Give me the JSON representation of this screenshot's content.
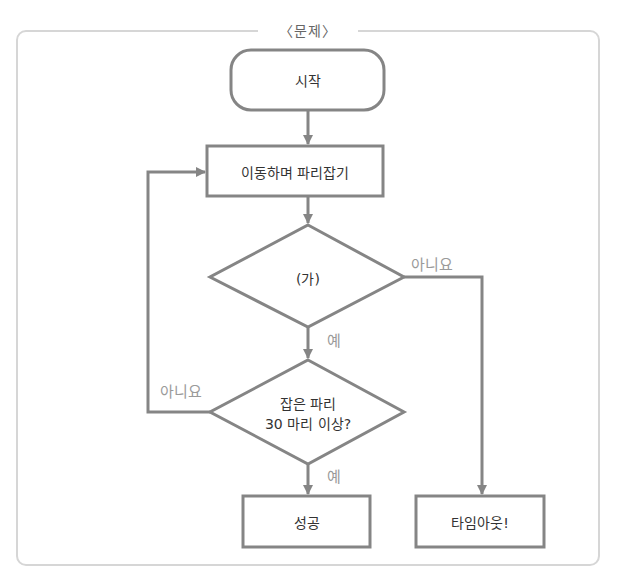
{
  "header": {
    "title": "〈문제〉"
  },
  "colors": {
    "stroke": "#858585",
    "frame": "#d6d6d6",
    "text": "#333333",
    "edge_label": "#9a9a9a"
  },
  "nodes": {
    "start": {
      "type": "terminal",
      "label": "시작"
    },
    "process": {
      "type": "process",
      "label": "이동하며 파리잡기"
    },
    "decision_a": {
      "type": "decision",
      "label": "(가)"
    },
    "decision_b": {
      "type": "decision",
      "line1": "잡은 파리",
      "line2": "30 마리 이상?"
    },
    "success": {
      "type": "process",
      "label": "성공"
    },
    "timeout": {
      "type": "process",
      "label": "타임아웃!"
    }
  },
  "edges": {
    "a_no": "아니요",
    "a_yes": "예",
    "b_no": "아니요",
    "b_yes": "예"
  }
}
